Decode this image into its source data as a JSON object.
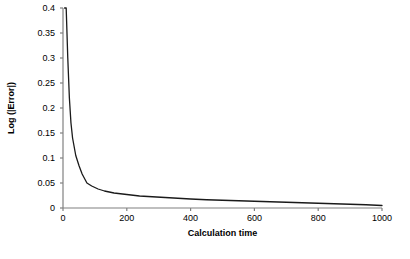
{
  "chart_data": {
    "type": "line",
    "title": "",
    "xlabel": "Calculation time",
    "ylabel": "Log (|Error|)",
    "xlim": [
      0,
      1000
    ],
    "ylim": [
      0,
      0.4
    ],
    "grid": false,
    "legend": "none",
    "xticks": [
      0,
      200,
      400,
      600,
      800,
      1000
    ],
    "xtick_labels": [
      "0",
      "200",
      "400",
      "600",
      "800",
      "1000"
    ],
    "yticks": [
      0,
      0.05,
      0.1,
      0.15,
      0.2,
      0.25,
      0.3,
      0.35,
      0.4
    ],
    "ytick_labels": [
      "0",
      "0.05",
      "0.1",
      "0.15",
      "0.2",
      "0.25",
      "0.3",
      "0.35",
      "0.4"
    ],
    "series": [
      {
        "name": "error",
        "color": "#1a1a1a",
        "x": [
          5,
          10,
          15,
          20,
          25,
          30,
          40,
          50,
          60,
          75,
          90,
          110,
          130,
          160,
          200,
          240,
          280,
          320,
          360,
          400,
          450,
          500,
          550,
          600,
          650,
          700,
          750,
          800,
          850,
          900,
          950,
          1000
        ],
        "y": [
          0.4,
          0.4,
          0.3,
          0.22,
          0.17,
          0.14,
          0.105,
          0.085,
          0.068,
          0.05,
          0.044,
          0.038,
          0.034,
          0.03,
          0.027,
          0.024,
          0.0225,
          0.021,
          0.0195,
          0.018,
          0.0165,
          0.0155,
          0.0145,
          0.0135,
          0.0125,
          0.0115,
          0.0105,
          0.0095,
          0.0085,
          0.0075,
          0.0065,
          0.005
        ]
      }
    ]
  },
  "axes": {
    "axis_color": "#808080",
    "line_color": "#1a1a1a"
  }
}
